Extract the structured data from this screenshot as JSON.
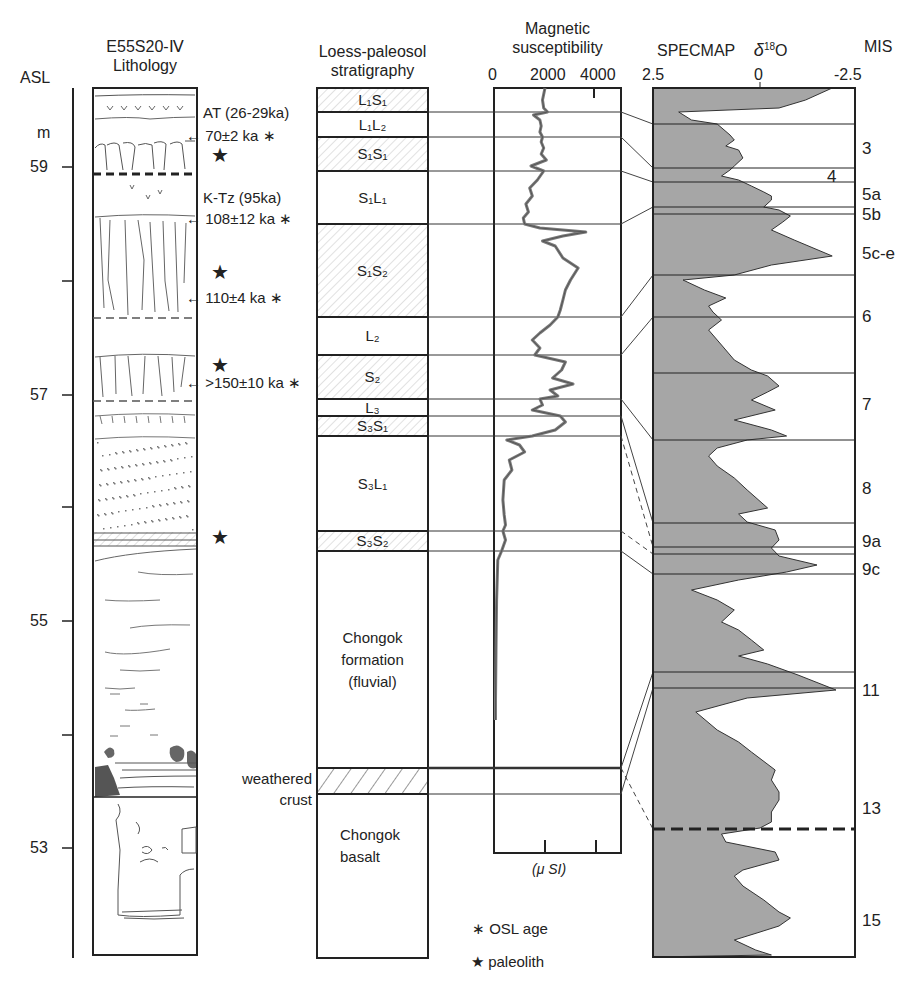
{
  "headers": {
    "asl": "ASL",
    "unit": "m",
    "lithology_line1": "E55S20-Ⅳ",
    "lithology_line2": "Lithology",
    "loess_line1": "Loess-paleosol",
    "loess_line2": "stratigraphy",
    "magsus_line1": "Magnetic",
    "magsus_line2": "susceptibility",
    "specmap": "SPECMAP",
    "delta": "δ",
    "delta_sup": "18",
    "delta_o": "O",
    "mis": "MIS"
  },
  "asl_axis": {
    "ticks": [
      {
        "value": "59",
        "y": 167,
        "labeled": true
      },
      {
        "value": "58",
        "y": 281,
        "labeled": false
      },
      {
        "value": "57",
        "y": 395,
        "labeled": true
      },
      {
        "value": "56",
        "y": 507,
        "labeled": false
      },
      {
        "value": "55",
        "y": 621,
        "labeled": true
      },
      {
        "value": "54",
        "y": 735,
        "labeled": false
      },
      {
        "value": "53",
        "y": 848,
        "labeled": true
      }
    ]
  },
  "lithology_annotations": [
    {
      "text": "AT (26-29ka)",
      "y": 113,
      "arrow": false
    },
    {
      "text": "70±2 ka ∗",
      "y": 136,
      "arrow": true
    },
    {
      "text": "K-Tz (95ka)",
      "y": 198,
      "arrow": false
    },
    {
      "text": "108±12 ka ∗",
      "y": 219,
      "arrow": true
    },
    {
      "text": "110±4 ka ∗",
      "y": 298,
      "arrow": true
    },
    {
      "text": ">150±10 ka ∗",
      "y": 383,
      "arrow": true
    }
  ],
  "paleolith_stars_y": [
    158,
    275,
    368,
    540
  ],
  "loess_units": [
    {
      "label": "L₁S₁",
      "top": 88,
      "bottom": 112,
      "type": "paleosol"
    },
    {
      "label": "L₁L₂",
      "top": 112,
      "bottom": 137,
      "type": "loess"
    },
    {
      "label": "S₁S₁",
      "top": 137,
      "bottom": 171,
      "type": "paleosol"
    },
    {
      "label": "S₁L₁",
      "top": 171,
      "bottom": 224,
      "type": "loess"
    },
    {
      "label": "S₁S₂",
      "top": 224,
      "bottom": 317,
      "type": "paleosol"
    },
    {
      "label": "L₂",
      "top": 317,
      "bottom": 355,
      "type": "loess"
    },
    {
      "label": "S₂",
      "top": 355,
      "bottom": 399,
      "type": "paleosol"
    },
    {
      "label": "L₃",
      "top": 399,
      "bottom": 416,
      "type": "loess"
    },
    {
      "label": "S₃S₁",
      "top": 416,
      "bottom": 436,
      "type": "paleosol"
    },
    {
      "label": "S₃L₁",
      "top": 436,
      "bottom": 531,
      "type": "loess"
    },
    {
      "label": "S₃S₂",
      "top": 531,
      "bottom": 551,
      "type": "paleosol"
    },
    {
      "label": "Chongok\nformation\n(fluvial)",
      "top": 551,
      "bottom": 768,
      "type": "fluvial"
    },
    {
      "label": "",
      "top": 768,
      "bottom": 794,
      "type": "crust"
    },
    {
      "label": "Chongok\nbasalt",
      "top": 794,
      "bottom": 958,
      "type": "basalt"
    }
  ],
  "weathered_crust_label": {
    "line1": "weathered",
    "line2": "crust"
  },
  "magsus": {
    "ticks": [
      "0",
      "2000",
      "4000"
    ],
    "unit": "(μ SI)",
    "x0": 494,
    "x_per_1000": 25.5,
    "curve": [
      [
        88,
        2000
      ],
      [
        100,
        1900
      ],
      [
        108,
        1950
      ],
      [
        112,
        2100
      ],
      [
        115,
        1550
      ],
      [
        120,
        1800
      ],
      [
        126,
        1850
      ],
      [
        132,
        1800
      ],
      [
        137,
        1900
      ],
      [
        142,
        1850
      ],
      [
        148,
        1950
      ],
      [
        154,
        1850
      ],
      [
        160,
        2050
      ],
      [
        166,
        1450
      ],
      [
        171,
        1950
      ],
      [
        180,
        1700
      ],
      [
        188,
        1400
      ],
      [
        196,
        1500
      ],
      [
        204,
        1250
      ],
      [
        212,
        1350
      ],
      [
        218,
        1150
      ],
      [
        224,
        1200
      ],
      [
        228,
        1800
      ],
      [
        232,
        3600
      ],
      [
        236,
        2700
      ],
      [
        241,
        1900
      ],
      [
        246,
        2400
      ],
      [
        258,
        2700
      ],
      [
        268,
        3300
      ],
      [
        280,
        3000
      ],
      [
        290,
        2800
      ],
      [
        300,
        2700
      ],
      [
        310,
        2600
      ],
      [
        317,
        2500
      ],
      [
        325,
        2200
      ],
      [
        333,
        1800
      ],
      [
        340,
        1500
      ],
      [
        348,
        1800
      ],
      [
        355,
        1600
      ],
      [
        362,
        2800
      ],
      [
        370,
        2650
      ],
      [
        378,
        2300
      ],
      [
        384,
        3100
      ],
      [
        390,
        2200
      ],
      [
        396,
        2500
      ],
      [
        399,
        1800
      ],
      [
        405,
        1900
      ],
      [
        410,
        1500
      ],
      [
        416,
        2600
      ],
      [
        422,
        2800
      ],
      [
        430,
        2400
      ],
      [
        436,
        1500
      ],
      [
        440,
        500
      ],
      [
        445,
        1000
      ],
      [
        452,
        1200
      ],
      [
        460,
        600
      ],
      [
        470,
        700
      ],
      [
        480,
        400
      ],
      [
        500,
        350
      ],
      [
        515,
        400
      ],
      [
        525,
        450
      ],
      [
        531,
        350
      ],
      [
        540,
        450
      ],
      [
        551,
        300
      ],
      [
        560,
        150
      ],
      [
        600,
        100
      ],
      [
        650,
        80
      ],
      [
        700,
        60
      ],
      [
        720,
        60
      ]
    ]
  },
  "specmap": {
    "ticks": [
      "2.5",
      "0",
      "-2.5"
    ],
    "x_left": 653,
    "x_zero": 760,
    "x_right": 855,
    "mis_boundaries": [
      124,
      168,
      182,
      207,
      214,
      275,
      317,
      373,
      440,
      523,
      547,
      554,
      574,
      672,
      688,
      829
    ],
    "mis_labels": [
      {
        "label": "3",
        "y": 150
      },
      {
        "label": "4",
        "y": 178,
        "inside": true
      },
      {
        "label": "5a",
        "y": 196
      },
      {
        "label": "5b",
        "y": 216
      },
      {
        "label": "5c-e",
        "y": 255
      },
      {
        "label": "6",
        "y": 318
      },
      {
        "label": "7",
        "y": 406
      },
      {
        "label": "8",
        "y": 490
      },
      {
        "label": "9a",
        "y": 543
      },
      {
        "label": "9c",
        "y": 571
      },
      {
        "label": "11",
        "y": 692
      },
      {
        "label": "13",
        "y": 810
      },
      {
        "label": "15",
        "y": 922
      }
    ],
    "curve": [
      [
        88,
        -1.9
      ],
      [
        100,
        -1.2
      ],
      [
        108,
        -0.5
      ],
      [
        112,
        1.9
      ],
      [
        120,
        1.6
      ],
      [
        124,
        1.0
      ],
      [
        135,
        0.7
      ],
      [
        140,
        0.6
      ],
      [
        146,
        0.8
      ],
      [
        150,
        0.5
      ],
      [
        158,
        0.4
      ],
      [
        166,
        0.6
      ],
      [
        170,
        0.7
      ],
      [
        176,
        0.9
      ],
      [
        180,
        0.5
      ],
      [
        186,
        0.2
      ],
      [
        192,
        -0.1
      ],
      [
        196,
        -0.3
      ],
      [
        200,
        -0.3
      ],
      [
        207,
        -0.1
      ],
      [
        210,
        -0.5
      ],
      [
        216,
        -0.8
      ],
      [
        222,
        -0.6
      ],
      [
        230,
        -0.3
      ],
      [
        240,
        -0.9
      ],
      [
        256,
        -1.9
      ],
      [
        265,
        -0.3
      ],
      [
        275,
        0.6
      ],
      [
        280,
        1.8
      ],
      [
        290,
        1.3
      ],
      [
        298,
        0.8
      ],
      [
        306,
        1.2
      ],
      [
        312,
        1.1
      ],
      [
        320,
        0.9
      ],
      [
        330,
        1.2
      ],
      [
        345,
        0.9
      ],
      [
        360,
        0.6
      ],
      [
        370,
        0.2
      ],
      [
        376,
        -0.2
      ],
      [
        386,
        -0.5
      ],
      [
        392,
        -0.2
      ],
      [
        400,
        0.2
      ],
      [
        410,
        -0.4
      ],
      [
        420,
        0.6
      ],
      [
        430,
        -0.3
      ],
      [
        436,
        -0.7
      ],
      [
        440,
        0.3
      ],
      [
        448,
        1.0
      ],
      [
        456,
        1.2
      ],
      [
        466,
        1.0
      ],
      [
        478,
        0.6
      ],
      [
        490,
        0.3
      ],
      [
        508,
        -0.2
      ],
      [
        514,
        0.5
      ],
      [
        522,
        0.3
      ],
      [
        530,
        -0.4
      ],
      [
        540,
        -0.5
      ],
      [
        548,
        -0.3
      ],
      [
        556,
        -0.5
      ],
      [
        565,
        -1.5
      ],
      [
        572,
        -0.7
      ],
      [
        580,
        0.5
      ],
      [
        590,
        1.6
      ],
      [
        600,
        1.0
      ],
      [
        610,
        0.6
      ],
      [
        622,
        0.9
      ],
      [
        630,
        0.5
      ],
      [
        640,
        0.2
      ],
      [
        650,
        -0.1
      ],
      [
        656,
        0.5
      ],
      [
        664,
        -0.2
      ],
      [
        675,
        -1.0
      ],
      [
        690,
        -2.0
      ],
      [
        698,
        0.3
      ],
      [
        712,
        1.5
      ],
      [
        730,
        1.0
      ],
      [
        742,
        0.5
      ],
      [
        752,
        0.2
      ],
      [
        770,
        -0.4
      ],
      [
        780,
        -0.3
      ],
      [
        792,
        -0.5
      ],
      [
        800,
        -0.5
      ],
      [
        812,
        -0.3
      ],
      [
        822,
        -0.3
      ],
      [
        828,
        0.0
      ],
      [
        834,
        0.9
      ],
      [
        842,
        0.8
      ],
      [
        852,
        -0.4
      ],
      [
        860,
        -0.5
      ],
      [
        870,
        0.4
      ],
      [
        876,
        0.6
      ],
      [
        886,
        0.4
      ],
      [
        900,
        -0.1
      ],
      [
        912,
        -0.5
      ],
      [
        918,
        -0.8
      ],
      [
        926,
        -0.5
      ],
      [
        932,
        0.0
      ],
      [
        940,
        0.6
      ],
      [
        950,
        0.1
      ],
      [
        955,
        -0.3
      ]
    ]
  },
  "legend": {
    "osl_symbol": "∗",
    "osl_label": "OSL age",
    "paleolith_symbol": "★",
    "paleolith_label": "paleolith"
  },
  "correlations": [
    {
      "from": 112,
      "to": 124,
      "dashed": false
    },
    {
      "from": 137,
      "to": 168,
      "dashed": false
    },
    {
      "from": 171,
      "to": 182,
      "dashed": false
    },
    {
      "from": 224,
      "to": 207,
      "dashed": false
    },
    {
      "from": 317,
      "to": 275,
      "dashed": false
    },
    {
      "from": 355,
      "to": 317,
      "dashed": false
    },
    {
      "from": 399,
      "to": 440,
      "dashed": false
    },
    {
      "from": 416,
      "to": 523,
      "dashed": false
    },
    {
      "from": 436,
      "to": 547,
      "dashed": true
    },
    {
      "from": 531,
      "to": 554,
      "dashed": true
    },
    {
      "from": 551,
      "to": 574,
      "dashed": false
    },
    {
      "from": 768,
      "to": 672,
      "dashed": false
    },
    {
      "from": 794,
      "to": 688,
      "dashed": false
    },
    {
      "from": 768,
      "to": 829,
      "dashed": true
    }
  ],
  "colors": {
    "ink": "#222222",
    "specmap_fill": "#a6a6a6",
    "magsus_line": "#7a7a7a",
    "hatch": "#b5b5b5"
  }
}
